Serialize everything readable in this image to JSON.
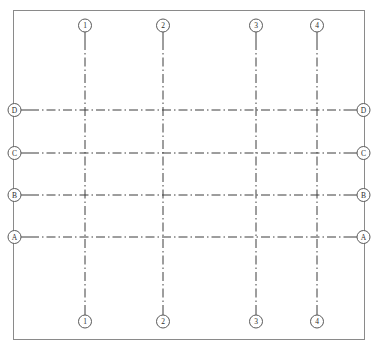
{
  "drawing": {
    "type": "structural-grid-plan",
    "width": 377,
    "height": 352,
    "background_color": "#ffffff",
    "line_color": "#3c3c3c",
    "bubble_stroke_color": "#5a5a5a",
    "bubble_fill_color": "#ffffff",
    "frame_color": "#8a8a8a",
    "line_style": "dash-dot",
    "frame": {
      "x": 13,
      "y": 10,
      "width": 352,
      "height": 330
    },
    "bubble_radius": 6.5
  },
  "chart_data": {
    "type": "scatter",
    "title": "",
    "xlabel": "",
    "ylabel": "",
    "grid": true,
    "legend": "none",
    "xlim": [
      13,
      365
    ],
    "ylim": [
      10,
      340
    ],
    "column_axes": [
      {
        "label": "1",
        "x": 85
      },
      {
        "label": "2",
        "x": 163
      },
      {
        "label": "3",
        "x": 256
      },
      {
        "label": "4",
        "x": 317
      }
    ],
    "row_axes": [
      {
        "label": "D",
        "y": 110
      },
      {
        "label": "C",
        "y": 153
      },
      {
        "label": "B",
        "y": 195
      },
      {
        "label": "A",
        "y": 237
      }
    ],
    "column_span_extent": {
      "top": 41,
      "bottom": 306
    },
    "row_span_extent": {
      "left": 30,
      "right": 348
    },
    "bubbles": {
      "top": [
        "1",
        "2",
        "3",
        "4"
      ],
      "bottom": [
        "1",
        "2",
        "3",
        "4"
      ],
      "left": [
        "D",
        "C",
        "B",
        "A"
      ],
      "right": [
        "D",
        "C",
        "B",
        "A"
      ]
    }
  }
}
